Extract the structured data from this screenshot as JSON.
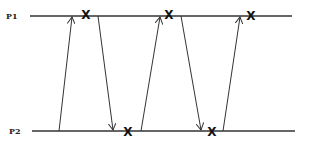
{
  "diagram": {
    "type": "space-time / message sequence diagram",
    "colors": {
      "line": "#333333",
      "mark": "#111111",
      "background": "#ffffff"
    },
    "processes": [
      {
        "id": "p1",
        "label": "P1",
        "y": 16,
        "x_start": 30,
        "x_end": 292,
        "label_x": 6
      },
      {
        "id": "p2",
        "label": "P2",
        "y": 131,
        "x_start": 32,
        "x_end": 295,
        "label_x": 9
      }
    ],
    "messages": [
      {
        "from": "P2",
        "to": "P1",
        "x1": 59,
        "y1": 131,
        "x2": 72,
        "y2": 17
      },
      {
        "from": "P1",
        "to": "P2",
        "x1": 98,
        "y1": 16,
        "x2": 113,
        "y2": 130
      },
      {
        "from": "P2",
        "to": "P1",
        "x1": 141,
        "y1": 131,
        "x2": 160,
        "y2": 17
      },
      {
        "from": "P1",
        "to": "P2",
        "x1": 181,
        "y1": 16,
        "x2": 201,
        "y2": 130
      },
      {
        "from": "P2",
        "to": "P1",
        "x1": 223,
        "y1": 131,
        "x2": 240,
        "y2": 17
      }
    ],
    "events": [
      {
        "process": "P1",
        "glyph": "X",
        "x": 86,
        "y": 15
      },
      {
        "process": "P1",
        "glyph": "X",
        "x": 169,
        "y": 15
      },
      {
        "process": "P1",
        "glyph": "X",
        "x": 251,
        "y": 16
      },
      {
        "process": "P2",
        "glyph": "X",
        "x": 128,
        "y": 132
      },
      {
        "process": "P2",
        "glyph": "X",
        "x": 212,
        "y": 132
      }
    ]
  }
}
